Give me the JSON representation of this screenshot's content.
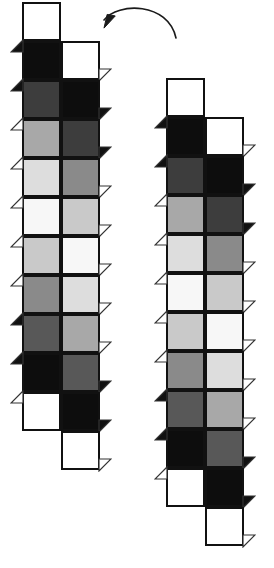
{
  "figure_caption": "",
  "diagram": {
    "title": "",
    "type": "paired-square-strip-diagram",
    "background": "#ffffff",
    "outline_color": "#111111",
    "cell_size": 39,
    "border_width": 2,
    "palette": {
      "white": "#ffffff",
      "near_white": "#f7f7f7",
      "light": "#dddddd",
      "light_mid": "#c9c9c9",
      "mid": "#a8a8a8",
      "mid_dark": "#8a8a8a",
      "dark": "#585858",
      "darker": "#3d3d3d",
      "black": "#0d0d0d"
    },
    "figures": [
      {
        "name": "left-strip",
        "origin_x": 22,
        "origin_y": 2,
        "rows": [
          {
            "left": "white",
            "right": null
          },
          {
            "left": "black",
            "right": "white"
          },
          {
            "left": "darker",
            "right": "black"
          },
          {
            "left": "mid",
            "right": "darker"
          },
          {
            "left": "light",
            "right": "mid_dark"
          },
          {
            "left": "near_white",
            "right": "light_mid"
          },
          {
            "left": "light_mid",
            "right": "near_white"
          },
          {
            "left": "mid_dark",
            "right": "light"
          },
          {
            "left": "dark",
            "right": "mid"
          },
          {
            "left": "black",
            "right": "dark"
          },
          {
            "left": "white",
            "right": "black"
          },
          {
            "left": null,
            "right": "white"
          }
        ]
      },
      {
        "name": "right-strip",
        "origin_x": 166,
        "origin_y": 78,
        "rows": [
          {
            "left": "white",
            "right": null
          },
          {
            "left": "black",
            "right": "white"
          },
          {
            "left": "darker",
            "right": "black"
          },
          {
            "left": "mid",
            "right": "darker"
          },
          {
            "left": "light",
            "right": "mid_dark"
          },
          {
            "left": "near_white",
            "right": "light_mid"
          },
          {
            "left": "light_mid",
            "right": "near_white"
          },
          {
            "left": "mid_dark",
            "right": "light"
          },
          {
            "left": "dark",
            "right": "mid"
          },
          {
            "left": "black",
            "right": "dark"
          },
          {
            "left": "white",
            "right": "black"
          },
          {
            "left": null,
            "right": "white"
          }
        ]
      }
    ],
    "arrow": {
      "name": "transform-arrow",
      "start_x": 176,
      "start_y": 38,
      "ctrl1_x": 168,
      "ctrl1_y": 2,
      "ctrl2_x": 118,
      "ctrl2_y": 2,
      "end_x": 104,
      "end_y": 20,
      "color": "#1a1a1a",
      "stroke_width": 1.6,
      "head_size": 9
    }
  }
}
